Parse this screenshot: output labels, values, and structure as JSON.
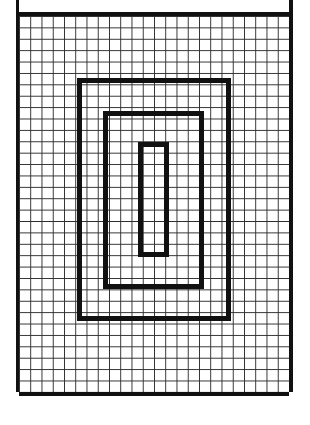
{
  "figure": {
    "grid": {
      "columns": 24,
      "rows": 33,
      "has_top_margin_band": true,
      "border_style": "thick black rules on left, right, top rule below margin band, and bottom"
    },
    "rectangles": [
      {
        "name": "outer-rectangle",
        "left": 58,
        "top": 62,
        "width": 154,
        "height": 243,
        "approx_cells_wide": 13,
        "approx_cells_tall": 21
      },
      {
        "name": "middle-rectangle",
        "left": 84,
        "top": 95,
        "width": 101,
        "height": 178,
        "approx_cells_wide": 8,
        "approx_cells_tall": 15
      },
      {
        "name": "inner-rectangle",
        "left": 119,
        "top": 126,
        "width": 31,
        "height": 115,
        "approx_cells_wide": 2,
        "approx_cells_tall": 10
      }
    ],
    "colors": {
      "ink": "#111111",
      "grid_line": "#2e2e2e",
      "paper": "#ffffff"
    }
  }
}
